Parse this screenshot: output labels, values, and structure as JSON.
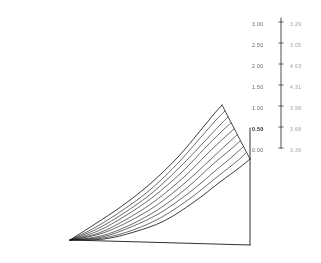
{
  "figure": {
    "kind": "3d-surface-mesh-plot",
    "background_color": "#ffffff",
    "line_color": "#1a1a1a",
    "label_color": "#4a4a4a",
    "emphasis_color": "#222222"
  },
  "axis": {
    "vertical_rule": {
      "name": "tick-axis-rule",
      "x": 281,
      "y_top": 18,
      "y_bottom": 148
    },
    "right_edge": {
      "name": "surface-right-axis",
      "x": 250,
      "y_top": 128,
      "y_bottom": 245
    },
    "baseline": {
      "name": "surface-baseline",
      "x_start": 70,
      "y_start": 240,
      "x_end": 250,
      "y_end": 245
    }
  },
  "left_scale": {
    "name": "left-tick-labels",
    "x": 252,
    "values": [
      "3.00",
      "2.50",
      "2.00",
      "1.50",
      "1.00",
      "0.50",
      "0.00"
    ],
    "y_positions": [
      20,
      41,
      62,
      83,
      104,
      125,
      146
    ],
    "emphasis_index": 5
  },
  "right_scale": {
    "name": "right-tick-labels",
    "x": 290,
    "values": [
      "3.29",
      "3.05",
      "4.63",
      "4.31",
      "3.98",
      "3.68",
      "3.36"
    ],
    "y_positions": [
      20,
      41,
      62,
      83,
      104,
      125,
      146
    ]
  },
  "chart_data": {
    "type": "line",
    "title": "",
    "subtitle": "",
    "xlabel": "",
    "ylabel": "",
    "grid": false,
    "legend": false,
    "projection": "3d-wireframe-ruled-surface",
    "mesh_line_count": 10,
    "axis_ranges": {
      "left_scale": [
        0.0,
        3.0
      ],
      "left_scale_step": 0.5
    },
    "apex": {
      "x": 70,
      "y": 240
    },
    "ridge_top": {
      "x": 222,
      "y": 105
    },
    "ridge_right": {
      "x": 250,
      "y": 128
    },
    "series": [
      {
        "name": "generator-1",
        "role": "top-ridge",
        "points": [
          [
            70,
            240
          ],
          [
            95,
            224
          ],
          [
            122,
            206
          ],
          [
            150,
            184
          ],
          [
            178,
            157
          ],
          [
            200,
            131
          ],
          [
            214,
            114
          ],
          [
            222,
            105
          ]
        ]
      },
      {
        "name": "generator-2",
        "points": [
          [
            70,
            240
          ],
          [
            96,
            227
          ],
          [
            123,
            210
          ],
          [
            151,
            189
          ],
          [
            179,
            162
          ],
          [
            201,
            137
          ],
          [
            216,
            120
          ],
          [
            225,
            111
          ]
        ]
      },
      {
        "name": "generator-3",
        "points": [
          [
            70,
            240
          ],
          [
            97,
            229
          ],
          [
            124,
            213
          ],
          [
            152,
            193
          ],
          [
            180,
            167
          ],
          [
            203,
            143
          ],
          [
            219,
            126
          ],
          [
            228,
            117
          ]
        ]
      },
      {
        "name": "generator-4",
        "points": [
          [
            70,
            240
          ],
          [
            98,
            231
          ],
          [
            125,
            216
          ],
          [
            153,
            197
          ],
          [
            182,
            172
          ],
          [
            205,
            148
          ],
          [
            221,
            132
          ],
          [
            231,
            123
          ]
        ]
      },
      {
        "name": "generator-5",
        "points": [
          [
            70,
            240
          ],
          [
            99,
            233
          ],
          [
            127,
            219
          ],
          [
            155,
            201
          ],
          [
            184,
            177
          ],
          [
            207,
            154
          ],
          [
            224,
            138
          ],
          [
            234,
            129
          ]
        ]
      },
      {
        "name": "generator-6",
        "points": [
          [
            70,
            240
          ],
          [
            100,
            234
          ],
          [
            128,
            222
          ],
          [
            157,
            205
          ],
          [
            186,
            182
          ],
          [
            210,
            160
          ],
          [
            227,
            144
          ],
          [
            237,
            135
          ]
        ]
      },
      {
        "name": "generator-7",
        "points": [
          [
            70,
            240
          ],
          [
            101,
            236
          ],
          [
            130,
            225
          ],
          [
            159,
            209
          ],
          [
            188,
            187
          ],
          [
            212,
            165
          ],
          [
            230,
            150
          ],
          [
            240,
            141
          ]
        ]
      },
      {
        "name": "generator-8",
        "points": [
          [
            70,
            240
          ],
          [
            102,
            237
          ],
          [
            131,
            227
          ],
          [
            160,
            213
          ],
          [
            190,
            192
          ],
          [
            215,
            171
          ],
          [
            233,
            156
          ],
          [
            243,
            147
          ]
        ]
      },
      {
        "name": "generator-9",
        "points": [
          [
            70,
            240
          ],
          [
            103,
            238
          ],
          [
            133,
            230
          ],
          [
            162,
            217
          ],
          [
            192,
            197
          ],
          [
            217,
            177
          ],
          [
            236,
            162
          ],
          [
            246,
            153
          ]
        ]
      },
      {
        "name": "generator-10",
        "role": "bottom-edge",
        "points": [
          [
            70,
            240
          ],
          [
            104,
            239
          ],
          [
            134,
            232
          ],
          [
            164,
            221
          ],
          [
            194,
            202
          ],
          [
            220,
            182
          ],
          [
            239,
            168
          ],
          [
            250,
            159
          ]
        ]
      }
    ]
  }
}
